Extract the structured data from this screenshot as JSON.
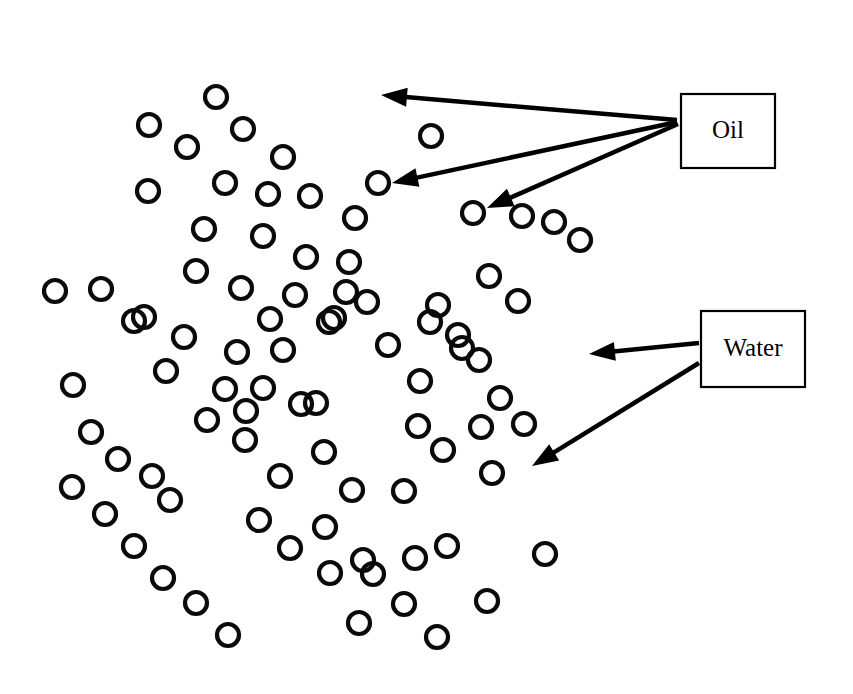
{
  "figure": {
    "type": "schematic-diagram",
    "title": "",
    "width": 853,
    "height": 694,
    "background_color": "#ffffff",
    "stroke_color": "#000000",
    "circle_color": "#0a0a0a",
    "circle_radius": 11,
    "circle_stroke_width": 4.2
  },
  "labels": [
    {
      "id": "oil",
      "text": "Oil",
      "box": {
        "x": 681,
        "y": 94,
        "width": 94,
        "height": 74
      },
      "text_x": 728,
      "text_y": 132
    },
    {
      "id": "water",
      "text": "Water",
      "box": {
        "x": 701,
        "y": 311,
        "width": 104,
        "height": 76
      },
      "text_x": 753,
      "text_y": 350
    }
  ],
  "pointers": [
    {
      "id": "oil-pointer-1",
      "label": "Oil",
      "from_x": 677,
      "from_y": 120,
      "to_x": 381,
      "to_y": 95
    },
    {
      "id": "oil-pointer-2",
      "label": "Oil",
      "from_x": 677,
      "from_y": 122,
      "to_x": 392,
      "to_y": 183
    },
    {
      "id": "oil-pointer-3",
      "label": "Oil",
      "from_x": 678,
      "from_y": 124,
      "to_x": 487,
      "to_y": 208
    },
    {
      "id": "water-pointer-1",
      "label": "Water",
      "from_x": 699,
      "from_y": 343,
      "to_x": 589,
      "to_y": 354
    },
    {
      "id": "water-pointer-2",
      "label": "Water",
      "from_x": 699,
      "from_y": 363,
      "to_x": 532,
      "to_y": 466
    }
  ],
  "particles": {
    "count": 86,
    "oil_droplets_indicated": 3,
    "water_regions_indicated": 2,
    "points": [
      [
        216,
        97
      ],
      [
        149,
        125
      ],
      [
        243,
        129
      ],
      [
        283,
        157
      ],
      [
        148,
        191
      ],
      [
        225,
        183
      ],
      [
        268,
        194
      ],
      [
        310,
        196
      ],
      [
        204,
        229
      ],
      [
        263,
        236
      ],
      [
        306,
        257
      ],
      [
        196,
        271
      ],
      [
        241,
        288
      ],
      [
        295,
        295
      ],
      [
        144,
        317
      ],
      [
        184,
        337
      ],
      [
        237,
        352
      ],
      [
        283,
        350
      ],
      [
        166,
        371
      ],
      [
        225,
        389
      ],
      [
        263,
        388
      ],
      [
        55,
        291
      ],
      [
        101,
        289
      ],
      [
        134,
        321
      ],
      [
        73,
        385
      ],
      [
        207,
        420
      ],
      [
        245,
        440
      ],
      [
        301,
        404
      ],
      [
        334,
        318
      ],
      [
        324,
        452
      ],
      [
        352,
        490
      ],
      [
        325,
        527
      ],
      [
        363,
        560
      ],
      [
        72,
        487
      ],
      [
        105,
        514
      ],
      [
        134,
        546
      ],
      [
        163,
        578
      ],
      [
        196,
        603
      ],
      [
        228,
        635
      ],
      [
        170,
        500
      ],
      [
        259,
        520
      ],
      [
        290,
        548
      ],
      [
        355,
        218
      ],
      [
        349,
        262
      ],
      [
        367,
        302
      ],
      [
        388,
        345
      ],
      [
        420,
        381
      ],
      [
        418,
        426
      ],
      [
        443,
        450
      ],
      [
        438,
        305
      ],
      [
        458,
        335
      ],
      [
        479,
        360
      ],
      [
        500,
        398
      ],
      [
        524,
        424
      ],
      [
        447,
        546
      ],
      [
        487,
        601
      ],
      [
        404,
        604
      ],
      [
        359,
        623
      ],
      [
        437,
        637
      ],
      [
        373,
        574
      ],
      [
        330,
        573
      ],
      [
        431,
        136
      ],
      [
        378,
        183
      ],
      [
        473,
        213
      ],
      [
        522,
        216
      ],
      [
        554,
        222
      ],
      [
        580,
        240
      ],
      [
        489,
        276
      ],
      [
        329,
        322
      ],
      [
        346,
        292
      ],
      [
        430,
        322
      ],
      [
        462,
        348
      ],
      [
        316,
        403
      ],
      [
        280,
        476
      ],
      [
        246,
        411
      ],
      [
        545,
        554
      ],
      [
        492,
        473
      ],
      [
        404,
        491
      ],
      [
        91,
        432
      ],
      [
        118,
        459
      ],
      [
        152,
        476
      ],
      [
        518,
        301
      ],
      [
        481,
        427
      ],
      [
        415,
        558
      ],
      [
        270,
        319
      ],
      [
        187,
        147
      ]
    ]
  }
}
